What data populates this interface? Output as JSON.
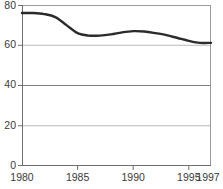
{
  "chart_data": {
    "type": "line",
    "title": "",
    "subtitle": "",
    "xlabel": "",
    "ylabel": "",
    "xlim": [
      1980,
      1997
    ],
    "ylim": [
      0,
      80
    ],
    "grid": true,
    "legend": "none",
    "y_ticks": [
      0,
      20,
      40,
      60,
      80
    ],
    "y_tick_labels": [
      "0",
      "20",
      "40",
      "60",
      "80"
    ],
    "x_ticks": [
      1980,
      1985,
      1990,
      1995,
      1997
    ],
    "x_tick_labels": [
      "1980",
      "1985",
      "1990",
      "1995",
      "1997"
    ],
    "series": [
      {
        "name": "series-1",
        "color": "#2b2b2b",
        "x": [
          1980,
          1981,
          1982,
          1983,
          1984,
          1985,
          1986,
          1987,
          1988,
          1989,
          1990,
          1991,
          1992,
          1993,
          1994,
          1995,
          1996,
          1997
        ],
        "values": [
          76,
          76,
          75.5,
          74,
          70,
          66,
          64.8,
          64.8,
          65.4,
          66.4,
          67,
          66.8,
          66,
          65,
          63.6,
          62.2,
          61.2,
          61.2
        ]
      }
    ]
  },
  "axes": {
    "line_color": "#9a9a9a",
    "grid_color": "#b9b9b9",
    "tick_text_color": "#3a3a3a"
  }
}
